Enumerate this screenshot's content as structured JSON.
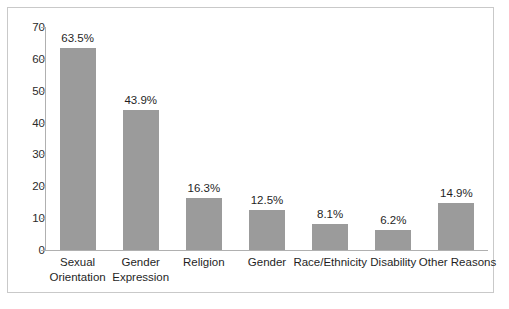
{
  "chart_data": {
    "type": "bar",
    "title": "",
    "subtitle": "",
    "xlabel": "",
    "ylabel": "",
    "ylim": [
      0,
      70
    ],
    "ytick_interval": 10,
    "yticks": [
      "70",
      "60",
      "50",
      "40",
      "30",
      "20",
      "10",
      "0"
    ],
    "grid": false,
    "legend": false,
    "legend_position": "none",
    "bar_color": "#9b9b9b",
    "axis_color": "#b0b0b0",
    "border_color": "#c9c9c9",
    "background_color": "#ffffff",
    "text_color": "#1f1f1f",
    "categories": [
      "Sexual Orientation",
      "Gender Expression",
      "Religion",
      "Gender",
      "Race/Ethnicity",
      "Disability",
      "Other Reasons"
    ],
    "category_lines": [
      [
        "Sexual",
        "Orientation"
      ],
      [
        "Gender",
        "Expression"
      ],
      [
        "Religion"
      ],
      [
        "Gender"
      ],
      [
        "Race/Ethnicity"
      ],
      [
        "Disability"
      ],
      [
        "Other Reasons"
      ]
    ],
    "values": [
      63.5,
      43.9,
      16.3,
      12.5,
      8.1,
      6.2,
      14.9
    ],
    "data_labels": [
      "63.5%",
      "43.9%",
      "16.3%",
      "12.5%",
      "8.1%",
      "6.2%",
      "14.9%"
    ]
  }
}
